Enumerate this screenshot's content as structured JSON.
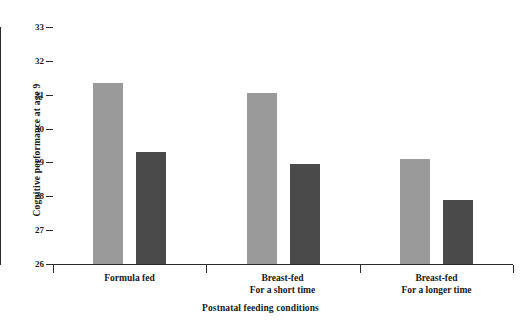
{
  "chart_data": {
    "type": "bar",
    "title": "",
    "xlabel": "Postnatal feeding conditions",
    "ylabel": "Cognitive performance at age 9",
    "categories": [
      "Formula fed",
      "Breast-fed For a short time",
      "Breast-fed For a longer time"
    ],
    "category_lines": [
      {
        "line1": "Formula fed",
        "line2": ""
      },
      {
        "line1": "Breast-fed",
        "line2": "For a short time"
      },
      {
        "line1": "Breast-fed",
        "line2": "For a longer time"
      }
    ],
    "series": [
      {
        "name": "light-gray-series",
        "color": "#9a9a9a",
        "values": [
          31.35,
          31.05,
          29.1
        ]
      },
      {
        "name": "dark-gray-series",
        "color": "#4a4a4a",
        "values": [
          29.3,
          28.95,
          27.9
        ]
      }
    ],
    "ylim": [
      26,
      33
    ],
    "yticks": [
      26,
      27,
      28,
      29,
      30,
      31,
      32,
      33
    ],
    "ytick_labels": [
      "26",
      "27",
      "28",
      "29",
      "30",
      "31",
      "32",
      "33"
    ],
    "grid": false,
    "legend": "none",
    "axis_color": "#2b2b2b",
    "background": "#ffffff"
  },
  "axis": {
    "y_title": "Cognitive performance at age 9",
    "x_title": "Postnatal feeding conditions"
  }
}
